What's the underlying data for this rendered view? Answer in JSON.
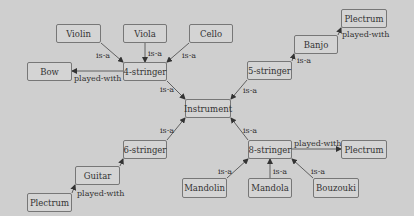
{
  "diagram": {
    "colors": {
      "background": "#cfcfcf",
      "node_fill": "#d4d4d4",
      "node_border": "#777777",
      "text": "#333333"
    },
    "nodes": [
      {
        "id": "violin",
        "label": "Violin",
        "x": 56,
        "y": 24,
        "w": 45,
        "h": 19
      },
      {
        "id": "viola",
        "label": "Viola",
        "x": 123,
        "y": 24,
        "w": 44,
        "h": 19
      },
      {
        "id": "cello",
        "label": "Cello",
        "x": 189,
        "y": 24,
        "w": 44,
        "h": 19
      },
      {
        "id": "bow",
        "label": "Bow",
        "x": 27,
        "y": 62,
        "w": 45,
        "h": 19
      },
      {
        "id": "four_stringer",
        "label": "4-stringer",
        "x": 123,
        "y": 62,
        "w": 44,
        "h": 19
      },
      {
        "id": "plectrum_top",
        "label": "Plectrum",
        "x": 341,
        "y": 9,
        "w": 46,
        "h": 19
      },
      {
        "id": "banjo",
        "label": "Banjo",
        "x": 294,
        "y": 35,
        "w": 44,
        "h": 19
      },
      {
        "id": "five_stringer",
        "label": "5-stringer",
        "x": 247,
        "y": 61,
        "w": 45,
        "h": 19
      },
      {
        "id": "instrument",
        "label": "Instrument",
        "x": 185,
        "y": 99,
        "w": 46,
        "h": 19
      },
      {
        "id": "six_stringer",
        "label": "6-stringer",
        "x": 123,
        "y": 140,
        "w": 44,
        "h": 19
      },
      {
        "id": "guitar",
        "label": "Guitar",
        "x": 75,
        "y": 166,
        "w": 45,
        "h": 19
      },
      {
        "id": "plectrum_left",
        "label": "Plectrum",
        "x": 27,
        "y": 193,
        "w": 45,
        "h": 19
      },
      {
        "id": "eight_stringer",
        "label": "8-stringer",
        "x": 248,
        "y": 140,
        "w": 44,
        "h": 19
      },
      {
        "id": "plectrum_right",
        "label": "Plectrum",
        "x": 341,
        "y": 140,
        "w": 46,
        "h": 19
      },
      {
        "id": "mandolin",
        "label": "Mandolin",
        "x": 182,
        "y": 178,
        "w": 45,
        "h": 20
      },
      {
        "id": "mandola",
        "label": "Mandola",
        "x": 248,
        "y": 178,
        "w": 44,
        "h": 20
      },
      {
        "id": "bouzouki",
        "label": "Bouzouki",
        "x": 313,
        "y": 178,
        "w": 46,
        "h": 20
      }
    ],
    "edges": [
      {
        "from": "violin",
        "to": "four_stringer",
        "label": "is-a",
        "x1": 101,
        "y1": 43,
        "x2": 123,
        "y2": 62,
        "lx": 96,
        "ly": 52
      },
      {
        "from": "viola",
        "to": "four_stringer",
        "label": "is-a",
        "x1": 145,
        "y1": 43,
        "x2": 145,
        "y2": 62,
        "lx": 148,
        "ly": 50
      },
      {
        "from": "cello",
        "to": "four_stringer",
        "label": "is-a",
        "x1": 189,
        "y1": 43,
        "x2": 167,
        "y2": 62,
        "lx": 182,
        "ly": 52
      },
      {
        "from": "four_stringer",
        "to": "bow",
        "label": "played-with",
        "x1": 123,
        "y1": 71,
        "x2": 72,
        "y2": 71,
        "lx": 74,
        "ly": 75
      },
      {
        "from": "four_stringer",
        "to": "instrument",
        "label": "is-a",
        "x1": 167,
        "y1": 81,
        "x2": 185,
        "y2": 99,
        "lx": 160,
        "ly": 86
      },
      {
        "from": "banjo",
        "to": "plectrum_top",
        "label": "played-with",
        "x1": 338,
        "y1": 35,
        "x2": 341,
        "y2": 28,
        "lx": 342,
        "ly": 31
      },
      {
        "from": "five_stringer",
        "to": "banjo",
        "label": "is-a",
        "x1": 292,
        "y1": 61,
        "x2": 294,
        "y2": 54,
        "lx": 297,
        "ly": 57
      },
      {
        "from": "five_stringer",
        "to": "instrument",
        "label": "is-a",
        "x1": 247,
        "y1": 80,
        "x2": 231,
        "y2": 99,
        "lx": 243,
        "ly": 87
      },
      {
        "from": "six_stringer",
        "to": "instrument",
        "label": "is-a",
        "x1": 167,
        "y1": 140,
        "x2": 185,
        "y2": 118,
        "lx": 160,
        "ly": 127
      },
      {
        "from": "guitar",
        "to": "six_stringer",
        "label": "",
        "x1": 120,
        "y1": 166,
        "x2": 123,
        "y2": 159,
        "lx": 0,
        "ly": 0
      },
      {
        "from": "plectrum_left",
        "to": "guitar",
        "label": "played-with",
        "x1": 72,
        "y1": 193,
        "x2": 75,
        "y2": 185,
        "lx": 77,
        "ly": 190
      },
      {
        "from": "eight_stringer",
        "to": "instrument",
        "label": "is-a",
        "x1": 248,
        "y1": 140,
        "x2": 231,
        "y2": 118,
        "lx": 243,
        "ly": 127
      },
      {
        "from": "eight_stringer",
        "to": "plectrum_right",
        "label": "played-with",
        "x1": 292,
        "y1": 149,
        "x2": 341,
        "y2": 149,
        "lx": 294,
        "ly": 140
      },
      {
        "from": "mandolin",
        "to": "eight_stringer",
        "label": "is-a",
        "x1": 227,
        "y1": 178,
        "x2": 248,
        "y2": 159,
        "lx": 218,
        "ly": 168
      },
      {
        "from": "mandola",
        "to": "eight_stringer",
        "label": "is-a",
        "x1": 270,
        "y1": 178,
        "x2": 270,
        "y2": 159,
        "lx": 273,
        "ly": 168
      },
      {
        "from": "bouzouki",
        "to": "eight_stringer",
        "label": "is-a",
        "x1": 313,
        "y1": 178,
        "x2": 292,
        "y2": 159,
        "lx": 311,
        "ly": 168
      }
    ]
  }
}
